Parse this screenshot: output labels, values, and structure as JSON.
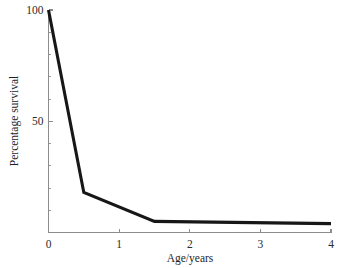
{
  "chart_data": {
    "type": "line",
    "title": "",
    "subtitle": "",
    "xlabel": "Age/years",
    "ylabel": "Percentage survival",
    "xlim": [
      0,
      4
    ],
    "ylim": [
      0,
      100
    ],
    "grid": false,
    "legend": null,
    "legend_position": "none",
    "x_ticks": [
      0,
      1,
      2,
      3,
      4
    ],
    "x_tick_labels": [
      "0",
      "1",
      "2",
      "3",
      "4"
    ],
    "y_ticks": [
      50,
      100
    ],
    "y_tick_labels": [
      "50",
      "100"
    ],
    "y_minor_ticks": [
      10,
      20,
      30,
      40,
      60,
      70,
      80,
      90
    ],
    "series": [
      {
        "name": "survivorship",
        "color": "#171717",
        "x": [
          0,
          0.5,
          1.5,
          4
        ],
        "y": [
          100,
          18,
          5,
          4
        ],
        "points": [
          {
            "x": 0,
            "y": 100
          },
          {
            "x": 0.5,
            "y": 18
          },
          {
            "x": 1.5,
            "y": 5
          },
          {
            "x": 4,
            "y": 4
          }
        ]
      }
    ],
    "annotations": []
  },
  "axes": {
    "x_axis_name": "x-axis",
    "y_axis_name": "y-axis"
  }
}
